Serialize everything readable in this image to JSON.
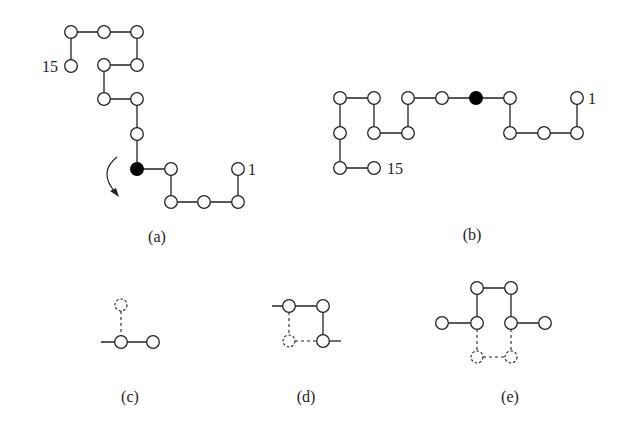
{
  "figure": {
    "panels": [
      {
        "id": "a",
        "caption": "(a)",
        "start_label": "1",
        "end_label": "15",
        "description": "15-residue lattice chain, pivot (filled) node with rotation arrow",
        "rotation_arrow": true
      },
      {
        "id": "b",
        "caption": "(b)",
        "start_label": "1",
        "end_label": "15",
        "description": "Chain after pivot rotation about the filled node"
      },
      {
        "id": "c",
        "caption": "(c)",
        "description": "End move: dashed position shows alternative site"
      },
      {
        "id": "d",
        "caption": "(d)",
        "description": "Corner flip: dashed site shows flipped corner"
      },
      {
        "id": "e",
        "caption": "(e)",
        "description": "Crankshaft move: two-residue dashed alternative"
      }
    ],
    "colors": {
      "line": "#222222",
      "node_fill": "#ffffff",
      "active_node_fill": "#000000",
      "background": "#ffffff"
    }
  }
}
